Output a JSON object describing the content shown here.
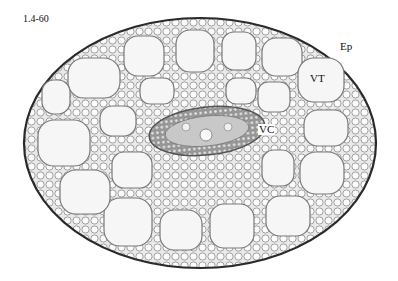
{
  "figure": {
    "id_label": "1.4-60",
    "labels": {
      "ep": "Ep",
      "vt": "VT",
      "vc": "VC"
    },
    "colors": {
      "background": "#ffffff",
      "cell_wall": "#6a6a6a",
      "cell_fill": "#f4f4f4",
      "epidermis": "#2a2a2a",
      "stele_fill": "#cfcfcf"
    }
  }
}
